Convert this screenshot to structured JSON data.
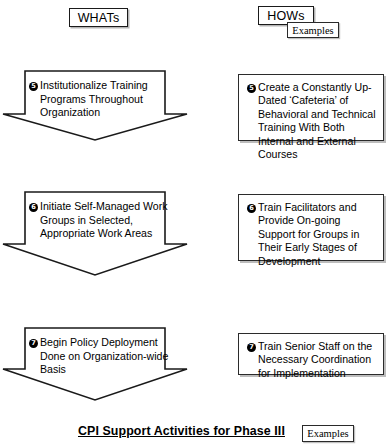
{
  "header": {
    "whats_label": "WHATs",
    "hows_label": "HOWs",
    "hows_examples_label": "Examples"
  },
  "whats_column": [
    {
      "number": "5",
      "text": "Institutionalize Training Programs Throughout Organization"
    },
    {
      "number": "6",
      "text": "Initiate Self-Managed Work Groups in Selected, Appropriate Work Areas"
    },
    {
      "number": "7",
      "text": "Begin Policy Deployment Done on Organization-wide Basis"
    }
  ],
  "hows_column": [
    {
      "number": "5",
      "text": "Create a Constantly Up-Dated ‘Cafeteria’ of Behavioral and Technical Training With Both Internal and External Courses"
    },
    {
      "number": "6",
      "text": "Train Facilitators and Provide On-going Support for Groups in Their Early Stages of Development"
    },
    {
      "number": "7",
      "text": "Train Senior Staff on the Necessary Coordination for Implementation"
    }
  ],
  "footer": {
    "caption": "CPI Support Activities for Phase III",
    "examples_label": "Examples"
  },
  "colors": {
    "stroke": "#1a1a1a",
    "background": "#ffffff",
    "shadow": "#878787",
    "bullet_fill": "#000000"
  }
}
